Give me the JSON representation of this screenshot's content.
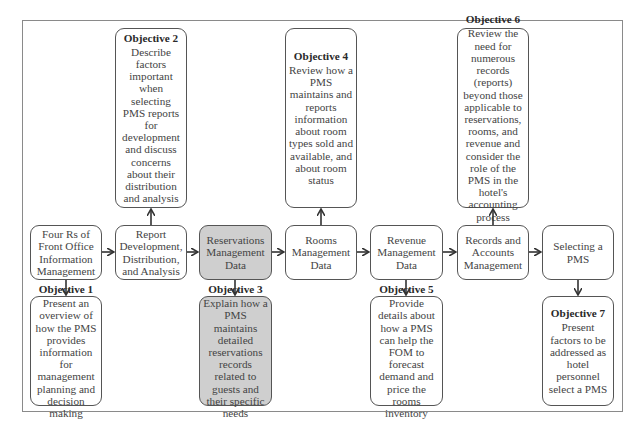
{
  "topics": [
    {
      "id": "four-rs",
      "label": "Four Rs of Front Office Information Management",
      "lines": [
        "Four Rs of",
        "Front Office",
        "Information",
        "Management"
      ],
      "shaded": false
    },
    {
      "id": "report-development",
      "label": "Report Development, Distribution, and Analysis",
      "lines": [
        "Report",
        "Development,",
        "Distribution,",
        "and Analysis"
      ],
      "shaded": false
    },
    {
      "id": "reservations",
      "label": "Reservations Management Data",
      "lines": [
        "Reservations",
        "Management",
        "Data"
      ],
      "shaded": true
    },
    {
      "id": "rooms",
      "label": "Rooms Management Data",
      "lines": [
        "Rooms",
        "Management",
        "Data"
      ],
      "shaded": false
    },
    {
      "id": "revenue",
      "label": "Revenue Management Data",
      "lines": [
        "Revenue",
        "Management",
        "Data"
      ],
      "shaded": false
    },
    {
      "id": "records",
      "label": "Records and Accounts Management",
      "lines": [
        "Records and",
        "Accounts",
        "Management"
      ],
      "shaded": false
    },
    {
      "id": "selecting",
      "label": "Selecting a PMS",
      "lines": [
        "Selecting a",
        "PMS"
      ],
      "shaded": false
    }
  ],
  "objectives": [
    {
      "title": "Objective 1",
      "desc": "Present an overview of how the PMS provides information for management planning and decision making",
      "topic": "four-rs",
      "position": "below"
    },
    {
      "title": "Objective 2",
      "desc": "Describe factors important when selecting PMS reports for development and discuss concerns about their distribution and analysis",
      "topic": "report-development",
      "position": "above"
    },
    {
      "title": "Objective 3",
      "desc": "Explain how a PMS maintains detailed reservations records related to guests and their specific needs",
      "topic": "reservations",
      "position": "below"
    },
    {
      "title": "Objective 4",
      "desc": "Review how a PMS maintains and reports information about room types sold and available, and about room status",
      "topic": "rooms",
      "position": "above"
    },
    {
      "title": "Objective 5",
      "desc": "Provide details about how a PMS can help the FOM to forecast demand and price the rooms inventory",
      "topic": "revenue",
      "position": "below"
    },
    {
      "title": "Objective 6",
      "desc": "Review the need for numerous records (reports) beyond those applicable to reservations, rooms, and revenue and consider the role of the PMS in the hotel's accounting process",
      "topic": "records",
      "position": "above"
    },
    {
      "title": "Objective 7",
      "desc": "Present factors to be addressed as hotel personnel select a PMS",
      "topic": "selecting",
      "position": "below"
    }
  ],
  "colors": {
    "shaded": "#cfcfcf",
    "border": "#555555",
    "frame": "#8a8a8a",
    "text": "#444444"
  }
}
